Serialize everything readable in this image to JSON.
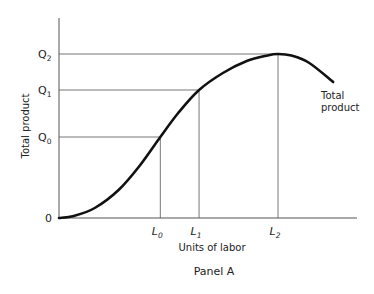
{
  "chart_data": {
    "type": "line",
    "title": "",
    "caption": "Panel A",
    "xlabel": "Units of labor",
    "ylabel": "Total product",
    "origin_label": "0",
    "grid": false,
    "legend": "none",
    "series": [
      {
        "name": "Total product",
        "label_position": "right-end",
        "description": "S-shaped total product curve rising from origin, inflecting near L0, peaking at L2 and then declining"
      }
    ],
    "x_ticks": [
      {
        "base": "L",
        "sub": "0"
      },
      {
        "base": "L",
        "sub": "1"
      },
      {
        "base": "L",
        "sub": "2"
      }
    ],
    "y_ticks": [
      {
        "base": "Q",
        "sub": "0"
      },
      {
        "base": "Q",
        "sub": "1"
      },
      {
        "base": "Q",
        "sub": "2"
      }
    ],
    "xlim": [
      0,
      1
    ],
    "ylim": [
      0,
      1
    ],
    "key_points": [
      {
        "x_tick": "L0",
        "y_tick": "Q0",
        "x": 0.34,
        "y": 0.405
      },
      {
        "x_tick": "L1",
        "y_tick": "Q1",
        "x": 0.47,
        "y": 0.64
      },
      {
        "x_tick": "L2",
        "y_tick": "Q2",
        "x": 0.735,
        "y": 0.82
      }
    ],
    "curve": [
      {
        "x": 0.0,
        "y": 0.0
      },
      {
        "x": 0.05,
        "y": 0.01
      },
      {
        "x": 0.12,
        "y": 0.05
      },
      {
        "x": 0.2,
        "y": 0.14
      },
      {
        "x": 0.27,
        "y": 0.26
      },
      {
        "x": 0.34,
        "y": 0.405
      },
      {
        "x": 0.4,
        "y": 0.525
      },
      {
        "x": 0.47,
        "y": 0.64
      },
      {
        "x": 0.55,
        "y": 0.725
      },
      {
        "x": 0.63,
        "y": 0.785
      },
      {
        "x": 0.7,
        "y": 0.813
      },
      {
        "x": 0.735,
        "y": 0.82
      },
      {
        "x": 0.78,
        "y": 0.812
      },
      {
        "x": 0.84,
        "y": 0.775
      },
      {
        "x": 0.92,
        "y": 0.68
      }
    ]
  }
}
